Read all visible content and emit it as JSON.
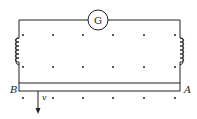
{
  "diagram": {
    "galvanometer": {
      "label": "G"
    },
    "rod_left_label": "B",
    "rod_right_label": "A",
    "velocity_label": "v",
    "field": "dots (out of page)",
    "colors": {
      "line": "#222222",
      "background": "#ffffff"
    }
  }
}
